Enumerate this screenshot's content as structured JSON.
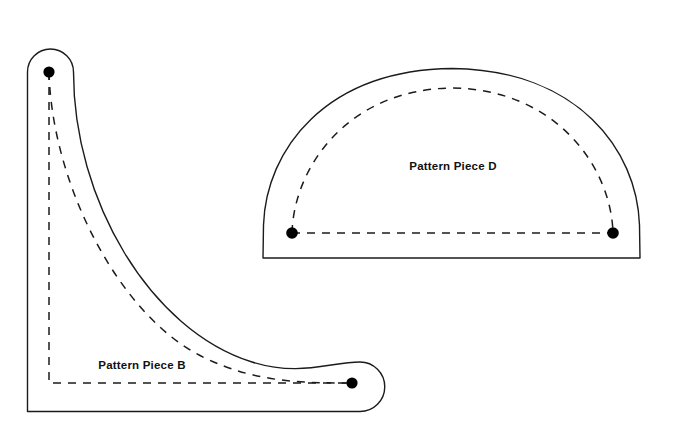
{
  "sheet": {
    "background_color": "#ffffff",
    "width": 676,
    "height": 434,
    "line_color": "#1b1b1b",
    "marker_color": "#000000"
  },
  "pieces": [
    {
      "id": "piece-b",
      "label": "Pattern Piece B",
      "label_x": 142,
      "label_y": 369,
      "shape": "l-shaped corner gusset with rounded ends",
      "cut_line_path": "M 27.5 72 A 23 23 0 0 1 73.5 72 C 73.5 200 150 330 252 362 C 300 377 330 362 360 362 A 24.5 24.5 0 0 1 360 411.5 L 27.5 411.5 Z",
      "seam_line_path": "M 49 72 C 52 185 120 318 205 358 C 255 382 300 383 352 383",
      "fold_line_path": "M 49 72 L 49 383 L 352 383",
      "markers": [
        {
          "name": "notch-dot-top",
          "x": 49,
          "y": 72,
          "r": 5.6
        },
        {
          "name": "notch-dot-right",
          "x": 352,
          "y": 383,
          "r": 5.6
        }
      ]
    },
    {
      "id": "piece-d",
      "label": "Pattern Piece D",
      "label_x": 453,
      "label_y": 170,
      "shape": "semicircular dome with flat base",
      "cut_line_path": "M 263 258 L 263.5 225 C 266 150 325 70 452 68.5 C 578 70 637 150 639.5 225 L 640 258 Z",
      "seam_line_path": "M 292 233 C 294 165 350 89 452 88 C 554 89 611 165 613 233",
      "hem_line_path": "M 292 233 L 613 233",
      "markers": [
        {
          "name": "notch-dot-left",
          "x": 292,
          "y": 233,
          "r": 5.8
        },
        {
          "name": "notch-dot-right",
          "x": 613,
          "y": 233,
          "r": 5.8
        }
      ]
    }
  ]
}
